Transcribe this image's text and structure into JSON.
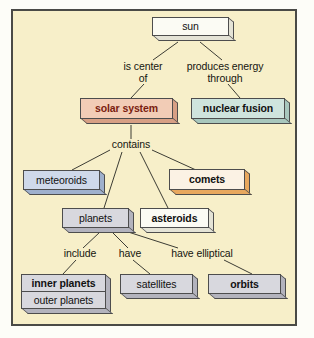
{
  "diagram": {
    "background_color": "#f7efc9",
    "frame_color": "#4a4a46",
    "nodes": [
      {
        "id": "sun",
        "label": "sun",
        "theme": "white",
        "bold": false
      },
      {
        "id": "solar-system",
        "label": "solar system",
        "theme": "salmon",
        "bold": true
      },
      {
        "id": "nuclear-fusion",
        "label": "nuclear fusion",
        "theme": "teal",
        "bold": true
      },
      {
        "id": "meteoroids",
        "label": "meteoroids",
        "theme": "blue",
        "bold": false
      },
      {
        "id": "comets",
        "label": "comets",
        "theme": "cream",
        "bold": true
      },
      {
        "id": "planets",
        "label": "planets",
        "theme": "gray",
        "bold": false
      },
      {
        "id": "asteroids",
        "label": "asteroids",
        "theme": "white",
        "bold": true
      },
      {
        "id": "inner-planets",
        "label": "inner planets",
        "theme": "gray",
        "bold": true
      },
      {
        "id": "outer-planets",
        "label": "outer planets",
        "theme": "gray",
        "bold": false
      },
      {
        "id": "satellites",
        "label": "satellites",
        "theme": "gray",
        "bold": false
      },
      {
        "id": "orbits",
        "label": "orbits",
        "theme": "gray",
        "bold": true
      }
    ],
    "edge_labels": [
      {
        "id": "is-center-of",
        "text": "is center\nof"
      },
      {
        "id": "produces-energy-through",
        "text": "produces energy\nthrough"
      },
      {
        "id": "contains",
        "text": "contains"
      },
      {
        "id": "include",
        "text": "include"
      },
      {
        "id": "have",
        "text": "have"
      },
      {
        "id": "have-elliptical",
        "text": "have elliptical"
      }
    ],
    "relationships": [
      {
        "from": "sun",
        "label": "is center of",
        "to": "solar system"
      },
      {
        "from": "sun",
        "label": "produces energy through",
        "to": "nuclear fusion"
      },
      {
        "from": "solar system",
        "label": "contains",
        "to": "meteoroids"
      },
      {
        "from": "solar system",
        "label": "contains",
        "to": "planets"
      },
      {
        "from": "solar system",
        "label": "contains",
        "to": "asteroids"
      },
      {
        "from": "solar system",
        "label": "contains",
        "to": "comets"
      },
      {
        "from": "planets",
        "label": "include",
        "to": "inner planets / outer planets"
      },
      {
        "from": "planets",
        "label": "have",
        "to": "satellites"
      },
      {
        "from": "planets",
        "label": "have elliptical",
        "to": "orbits"
      }
    ]
  }
}
